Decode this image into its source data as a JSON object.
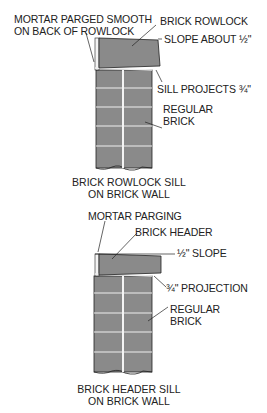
{
  "figures": [
    {
      "id": "rowlock",
      "caption_line1": "BRICK ROWLOCK SILL",
      "caption_line2": "ON BRICK WALL",
      "labels": {
        "mortar_line1": "MORTAR PARGED SMOOTH",
        "mortar_line2": "ON BACK OF ROWLOCK",
        "brick": "BRICK ROWLOCK",
        "slope": "SLOPE ABOUT ½\"",
        "projection": "SILL PROJECTS ¾\"",
        "regular_line1": "REGULAR",
        "regular_line2": "BRICK"
      }
    },
    {
      "id": "header",
      "caption_line1": "BRICK HEADER SILL",
      "caption_line2": "ON BRICK WALL",
      "labels": {
        "mortar": "MORTAR PARGING",
        "brick": "BRICK HEADER",
        "slope": "½\" SLOPE",
        "projection": "¾\" PROJECTION",
        "regular_line1": "REGULAR",
        "regular_line2": "BRICK"
      }
    }
  ],
  "colors": {
    "brick": "#8a8a8a",
    "line": "#222222",
    "mortar": "#f2f2f2"
  }
}
